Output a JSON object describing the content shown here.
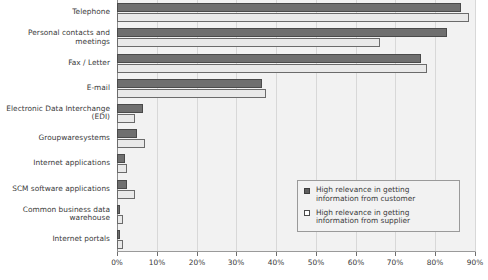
{
  "chart_data": {
    "type": "bar",
    "orientation": "horizontal",
    "title": "",
    "subtitle": "",
    "xlabel": "",
    "ylabel": "",
    "xlim": [
      0,
      90
    ],
    "xtick_labels": [
      "0%",
      "10%",
      "20%",
      "30%",
      "40%",
      "50%",
      "60%",
      "70%",
      "80%",
      "90%"
    ],
    "xtick_values": [
      0,
      10,
      20,
      30,
      40,
      50,
      60,
      70,
      80,
      90
    ],
    "grid": true,
    "grid_axis": "x",
    "legend_position": "inside-right-lower",
    "categories": [
      "Telephone",
      "Personal contacts and meetings",
      "Fax / Letter",
      "E-mail",
      "Electronic Data Interchange (EDI)",
      "Groupwaresystems",
      "Internet applications",
      "SCM software applications",
      "Common business data warehouse",
      "Internet portals"
    ],
    "category_label_lines": [
      [
        "Telephone"
      ],
      [
        "Personal contacts and meetings"
      ],
      [
        "Fax / Letter"
      ],
      [
        "E-mail"
      ],
      [
        "Electronic Data Interchange",
        "(EDI)"
      ],
      [
        "Groupwaresystems"
      ],
      [
        "Internet applications"
      ],
      [
        "SCM software applications"
      ],
      [
        "Common business data",
        "warehouse"
      ],
      [
        "Internet portals"
      ]
    ],
    "series": [
      {
        "name": "High relevance in getting information from customer",
        "color": "#6f6f6f",
        "values": [
          86.5,
          83.0,
          76.5,
          36.5,
          6.5,
          5.0,
          2.0,
          2.5,
          0.8,
          0.8
        ]
      },
      {
        "name": "High relevance in getting information from supplier",
        "color": "#e9e9e9",
        "values": [
          88.5,
          66.0,
          78.0,
          37.5,
          4.5,
          7.0,
          2.5,
          4.5,
          1.5,
          1.5
        ]
      }
    ]
  },
  "legend": {
    "entries": [
      {
        "swatch": "dark",
        "line1": "High relevance in getting",
        "line2": "information from customer"
      },
      {
        "swatch": "light",
        "line1": "High relevance in getting",
        "line2": "information from supplier"
      }
    ]
  },
  "colors": {
    "customer_bar": "#6f6f6f",
    "supplier_bar": "#e9e9e9",
    "plot_background": "#f2f2f2",
    "gridline": "#d8d8d8",
    "axis": "#8c8c8c",
    "text": "#3a3a3a"
  }
}
